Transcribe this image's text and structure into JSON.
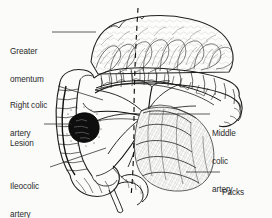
{
  "figure": {
    "kind": "anatomical-line-drawing",
    "background_color": "#fbfbfa",
    "ink_color": "#1a1a1a",
    "label_color": "#2a2a2a"
  },
  "labels": {
    "greater_omentum": {
      "line1": "Greater",
      "line2": "omentum",
      "full": "Greater omentum",
      "side": "left"
    },
    "right_colic_artery": {
      "line1": "Right colic",
      "line2": "artery",
      "full": "Right colic artery",
      "side": "left"
    },
    "lesion": {
      "line1": "Lesion",
      "full": "Lesion",
      "side": "left"
    },
    "ileocolic_artery": {
      "line1": "Ileocolic",
      "line2": "artery",
      "full": "Ileocolic artery",
      "side": "left"
    },
    "middle_colic_artery": {
      "line1": "Middle",
      "line2": "colic",
      "line3": "artery",
      "full": "Middle colic artery",
      "side": "right"
    },
    "packs": {
      "line1": "Packs",
      "full": "Packs",
      "side": "right"
    }
  },
  "structures": [
    {
      "name": "greater-omentum",
      "description": "Lobulated fatty apron draped across the top of the field"
    },
    {
      "name": "transverse-colon",
      "description": "Haustrated colon running horizontally below the omentum"
    },
    {
      "name": "ascending-colon",
      "description": "Haustrated colon running down the left of the field"
    },
    {
      "name": "cecum",
      "description": "Blind pouch at the lower left with appendix"
    },
    {
      "name": "appendix",
      "description": "Thin tubular structure below the cecum"
    },
    {
      "name": "mesocolon",
      "description": "Fan of mesentery carrying the colic vessels"
    },
    {
      "name": "marginal-arcade",
      "description": "Vascular arcade along the mesenteric border of the colon"
    },
    {
      "name": "lesion-mass",
      "description": "Dark solid tumour mass on the ascending colon"
    },
    {
      "name": "surgical-packs",
      "description": "Cross-hatched gauze packs filling the lower right field"
    },
    {
      "name": "midline-dashed",
      "description": "Vertical dashed reference line through the centre"
    }
  ]
}
